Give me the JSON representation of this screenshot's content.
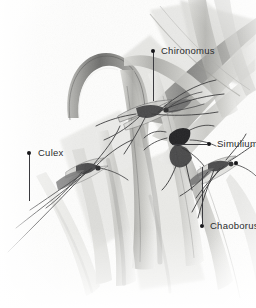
{
  "figure": {
    "kind": "scientific-illustration",
    "medium": "graphite pencil drawing",
    "palette": {
      "background": "#fdfdfc",
      "ink": "#2b2b2d",
      "leader": "#3a3a3e",
      "marker": "#17171a",
      "grass_light": "#e9e9e6",
      "grass_mid": "#b9b9b5",
      "grass_dark": "#8a8a87",
      "grass_deep": "#5f5f5d",
      "insect": "#3b3b3c"
    }
  },
  "labels": [
    {
      "id": "chironomus",
      "text": "Chironomus",
      "text_x": 161,
      "text_y": 46,
      "dot_x": 151,
      "dot_y": 49,
      "leader": {
        "orientation": "vertical",
        "x": 153,
        "y": 52,
        "length": 49
      }
    },
    {
      "id": "culex",
      "text": "Culex",
      "text_x": 38,
      "text_y": 148,
      "dot_x": 27,
      "dot_y": 151,
      "leader": {
        "orientation": "vertical",
        "x": 29,
        "y": 154,
        "length": 47
      }
    },
    {
      "id": "simulium",
      "text": "Simulium",
      "text_x": 217,
      "text_y": 139,
      "dot_x": 207,
      "dot_y": 142,
      "leader": {
        "orientation": "horizontal",
        "x": 172,
        "y": 144,
        "length": 35
      }
    },
    {
      "id": "chaoborus",
      "text": "Chaoborus",
      "text_x": 210,
      "text_y": 221,
      "dot_x": 200,
      "dot_y": 224,
      "leader": {
        "orientation": "vertical",
        "x": 202,
        "y": 167,
        "length": 57
      }
    }
  ],
  "insect_markers": [
    {
      "id": "chaoborus-body-marker",
      "dot_x": 234,
      "dot_y": 161
    }
  ]
}
